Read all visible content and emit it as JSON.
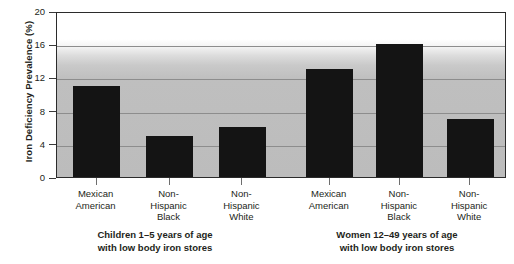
{
  "chart_data": {
    "type": "bar",
    "title": "",
    "xlabel": "",
    "ylabel": "Iron Deficiency Prevalence (%)",
    "ylim": [
      0,
      20
    ],
    "yticks": [
      0,
      4,
      8,
      12,
      16,
      20
    ],
    "ytick_labels": [
      "0",
      "4",
      "8",
      "12",
      "16",
      "20"
    ],
    "gridlines": [
      4,
      8,
      12,
      16
    ],
    "grid": true,
    "legend": "none",
    "bar_color": "#141414",
    "categories": [
      "Mexican American",
      "Non-Hispanic Black",
      "Non-Hispanic White",
      "Mexican American",
      "Non-Hispanic Black",
      "Non-Hispanic White"
    ],
    "values": [
      11,
      5,
      6,
      13,
      16,
      7
    ],
    "groups": [
      {
        "caption_line1": "Children 1–5 years of age",
        "caption_line2": "with low body iron stores",
        "categories": [
          "Mexican American",
          "Non-Hispanic Black",
          "Non-Hispanic White"
        ],
        "values": [
          11,
          5,
          6
        ]
      },
      {
        "caption_line1": "Women 12–49 years of age",
        "caption_line2": "with low body iron stores",
        "categories": [
          "Mexican American",
          "Non-Hispanic Black",
          "Non-Hispanic White"
        ],
        "values": [
          13,
          16,
          7
        ]
      }
    ],
    "bars": [
      {
        "label_line1": "Mexican",
        "label_line2": "American",
        "label_line3": "",
        "value": 11
      },
      {
        "label_line1": "Non-",
        "label_line2": "Hispanic",
        "label_line3": "Black",
        "value": 5
      },
      {
        "label_line1": "Non-",
        "label_line2": "Hispanic",
        "label_line3": "White",
        "value": 6
      },
      {
        "label_line1": "Mexican",
        "label_line2": "American",
        "label_line3": "",
        "value": 13
      },
      {
        "label_line1": "Non-",
        "label_line2": "Hispanic",
        "label_line3": "Black",
        "value": 16
      },
      {
        "label_line1": "Non-",
        "label_line2": "Hispanic",
        "label_line3": "White",
        "value": 7
      }
    ]
  }
}
